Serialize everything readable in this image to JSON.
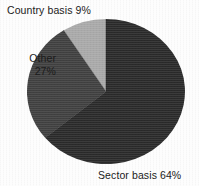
{
  "figure": {
    "background_color": "#fdfdfd",
    "text_color": "#1b1b1b"
  },
  "chart_data": {
    "type": "pie",
    "title": "",
    "subtitle": "",
    "xlabel": "",
    "ylabel": "",
    "legend_position": "none",
    "grid": false,
    "labels_placement": "outside-callout",
    "start_angle_deg": 0,
    "direction": "clockwise",
    "categories": [
      "Sector basis",
      "Other",
      "Country basis"
    ],
    "values": [
      64,
      27,
      9
    ],
    "units": "percent",
    "total": 100,
    "colors": [
      "#2b2b2b",
      "#3f3f3f",
      "#a9a9a9"
    ],
    "slices": [
      {
        "name": "Sector basis",
        "value": 64,
        "value_label": "64%",
        "label": "Sector basis 64%",
        "color": "#2b2b2b",
        "start_angle_deg": 0,
        "end_angle_deg": 230.4
      },
      {
        "name": "Other",
        "value": 27,
        "value_label": "27%",
        "label": "Other 27%",
        "color": "#3f3f3f",
        "start_angle_deg": 230.4,
        "end_angle_deg": 327.6
      },
      {
        "name": "Country basis",
        "value": 9,
        "value_label": "9%",
        "label": "Country basis 9%",
        "color": "#a9a9a9",
        "start_angle_deg": 327.6,
        "end_angle_deg": 360
      }
    ]
  },
  "labels": {
    "country": "Country basis 9%",
    "other_name": "Other",
    "other_pct": "27%",
    "sector": "Sector basis 64%"
  }
}
